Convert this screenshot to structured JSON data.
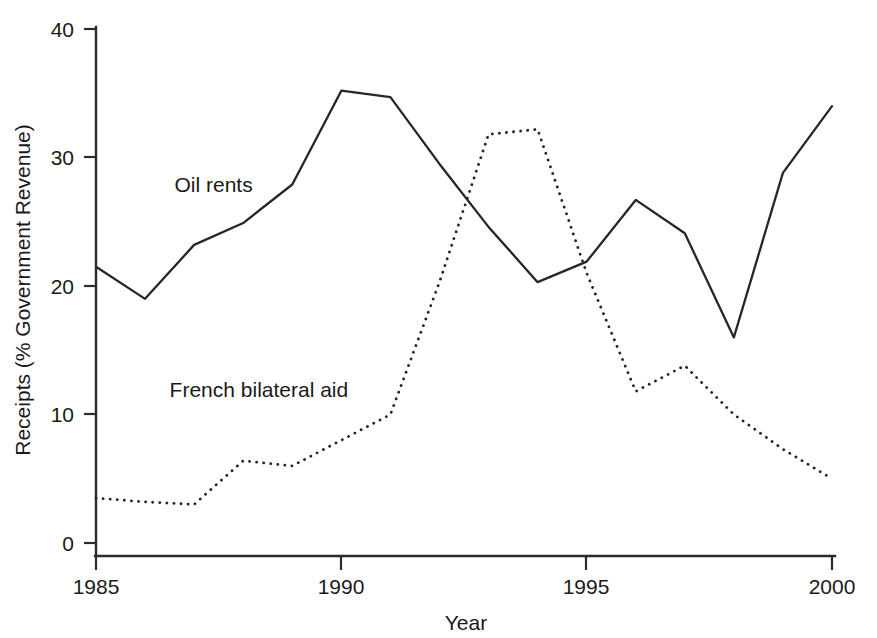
{
  "chart_data": {
    "type": "line",
    "title": "",
    "xlabel": "Year",
    "ylabel": "Receipts (% Government Revenue)",
    "x": [
      1985,
      1986,
      1987,
      1988,
      1989,
      1990,
      1991,
      1992,
      1993,
      1994,
      1995,
      1996,
      1997,
      1998,
      1999,
      2000
    ],
    "xlim": [
      1985,
      2000
    ],
    "ylim": [
      0,
      40
    ],
    "xticks": [
      1985,
      1990,
      1995,
      2000
    ],
    "yticks": [
      0,
      10,
      20,
      30,
      40
    ],
    "xtick_labels": [
      "1985",
      "1990",
      "1995",
      "2000"
    ],
    "ytick_labels": [
      "0",
      "10",
      "20",
      "30",
      "40"
    ],
    "grid": false,
    "legend_position": "inline-annotations",
    "series": [
      {
        "name": "Oil rents",
        "style": "solid",
        "color": "#262626",
        "values": [
          21.5,
          19.0,
          23.2,
          24.9,
          27.9,
          35.2,
          34.7,
          29.5,
          24.6,
          20.3,
          21.9,
          26.7,
          24.1,
          16.0,
          28.8,
          34.0
        ]
      },
      {
        "name": "French bilateral aid",
        "style": "dotted",
        "color": "#262626",
        "values": [
          3.5,
          3.2,
          3.0,
          6.4,
          6.0,
          8.0,
          10.0,
          20.3,
          31.8,
          32.2,
          21.0,
          11.8,
          13.8,
          10.0,
          7.3,
          5.0
        ]
      }
    ],
    "annotations": [
      {
        "text": "Oil rents",
        "x": 1986.6,
        "y": 27.3
      },
      {
        "text": "French bilateral aid",
        "x": 1986.5,
        "y": 11.4
      }
    ]
  },
  "axes": {
    "x_title": "Year",
    "y_title": "Receipts (% Government Revenue)"
  },
  "ticks": {
    "y": [
      "40",
      "30",
      "20",
      "10",
      "0"
    ],
    "x": [
      "1985",
      "1990",
      "1995",
      "2000"
    ]
  },
  "labels": {
    "series_a": "Oil rents",
    "series_b": "French bilateral aid"
  }
}
